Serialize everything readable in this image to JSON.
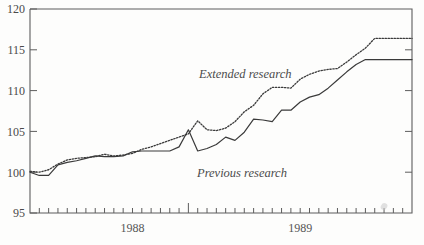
{
  "chart_data": {
    "type": "line",
    "title": "",
    "xlabel": "",
    "ylabel": "",
    "ylim": [
      95,
      120
    ],
    "y_ticks": [
      95,
      100,
      105,
      110,
      115,
      120
    ],
    "x_tick_labels": [
      "1988",
      "1989"
    ],
    "x_tick_label_positions": [
      11,
      29
    ],
    "grid": false,
    "legend": "inline-annotations",
    "n_points": 42,
    "x_major_tick_index": 17,
    "series": [
      {
        "name": "Extended research",
        "style": "dotted",
        "color": "#3a3a3a",
        "annotation": "Extended research",
        "values": [
          100.1,
          100.0,
          100.3,
          101.0,
          101.5,
          101.7,
          101.8,
          101.9,
          102.2,
          102.0,
          102.1,
          102.3,
          102.8,
          103.1,
          103.5,
          103.9,
          104.3,
          104.7,
          106.3,
          105.2,
          105.1,
          105.4,
          106.2,
          107.4,
          108.2,
          109.6,
          110.4,
          110.4,
          110.3,
          111.4,
          112.0,
          112.4,
          112.6,
          112.7,
          113.5,
          114.4,
          115.2,
          116.4,
          116.4,
          116.4,
          116.4,
          116.4
        ]
      },
      {
        "name": "Previous research",
        "style": "solid",
        "color": "#3a3a3a",
        "annotation": "Previous research",
        "values": [
          100.0,
          99.6,
          99.6,
          100.9,
          101.2,
          101.4,
          101.7,
          102.0,
          101.9,
          101.9,
          102.0,
          102.5,
          102.6,
          102.6,
          102.6,
          102.6,
          103.1,
          105.2,
          102.6,
          102.9,
          103.4,
          104.3,
          103.9,
          104.9,
          106.5,
          106.4,
          106.2,
          107.6,
          107.6,
          108.6,
          109.2,
          109.5,
          110.3,
          111.3,
          112.3,
          113.2,
          113.8,
          113.8,
          113.8,
          113.8,
          113.8,
          113.8
        ]
      }
    ]
  },
  "axis": {
    "y_tick_labels": [
      "120",
      "115",
      "110",
      "105",
      "100",
      "95"
    ],
    "x_labels": [
      "1988",
      "1989"
    ]
  },
  "annotations": {
    "upper": "Extended research",
    "lower": "Previous research"
  }
}
